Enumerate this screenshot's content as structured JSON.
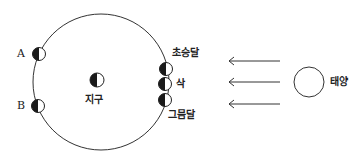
{
  "labels": {
    "a": "A",
    "b": "B",
    "earth": "지구",
    "first_crescent": "초승달",
    "new_moon": "삭",
    "waning_crescent": "그믐달",
    "sun": "태양"
  },
  "colors": {
    "line": "#333333",
    "shade": "#1a1a1a",
    "background": "#ffffff"
  }
}
